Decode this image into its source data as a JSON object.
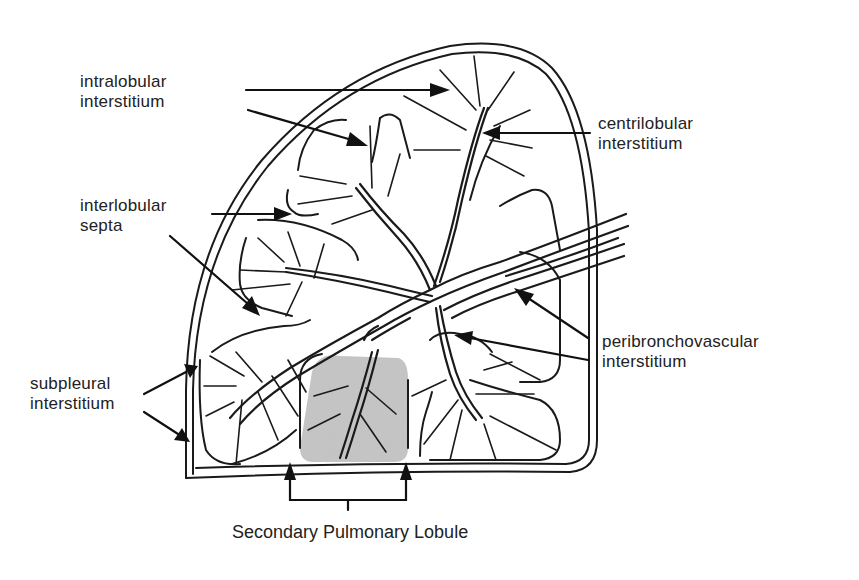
{
  "figure": {
    "title": "Secondary Pulmonary Lobule",
    "shaded_region_color": "#bdbdbd",
    "line_color": "#1a1a1a",
    "background": "#ffffff"
  },
  "labels": {
    "intralobular": {
      "line1": "intralobular",
      "line2": "interstitium"
    },
    "centrilobular": {
      "line1": "centrilobular",
      "line2": "interstitium"
    },
    "interlobular": {
      "line1": "interlobular",
      "line2": "septa"
    },
    "peribronchovascular": {
      "line1": "peribronchovascular",
      "line2": "interstitium"
    },
    "subpleural": {
      "line1": "subpleural",
      "line2": "interstitium"
    }
  },
  "caption": "Secondary Pulmonary Lobule"
}
